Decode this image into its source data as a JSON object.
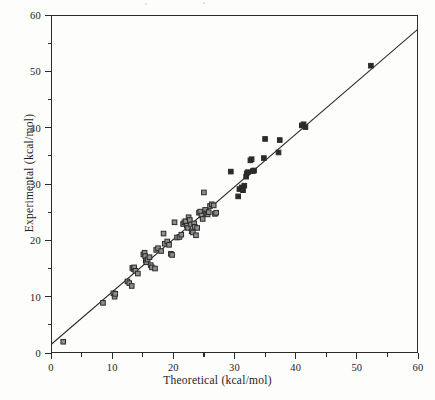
{
  "figure": {
    "title": "",
    "background_color": "#fdfdfc",
    "ink_color": "#2b2b2b"
  },
  "axes": {
    "x": {
      "label": "Theoretical (kcal/mol)",
      "major_ticks": [
        "0",
        "10",
        "20",
        "30",
        "40",
        "50",
        "60"
      ],
      "minor_ticks": [
        5,
        15,
        25,
        35,
        45,
        55
      ],
      "min": 0,
      "max": 60
    },
    "y": {
      "label": "Experimental (kcal/mol)",
      "major_ticks": [
        "0",
        "10",
        "20",
        "30",
        "40",
        "50",
        "60"
      ],
      "minor_ticks": [
        5,
        15,
        25,
        35,
        45,
        55
      ],
      "min": 0,
      "max": 60
    }
  },
  "chart_data": {
    "type": "scatter",
    "title": "",
    "xlabel": "Theoretical (kcal/mol)",
    "ylabel": "Experimental (kcal/mol)",
    "xlim": [
      0,
      60
    ],
    "ylim": [
      0,
      60
    ],
    "xticks": [
      0,
      10,
      20,
      30,
      40,
      50,
      60
    ],
    "yticks": [
      0,
      10,
      20,
      30,
      40,
      50,
      60
    ],
    "grid": false,
    "legend": null,
    "marker": {
      "shape": "square",
      "size_px": 4.6,
      "edge_color": "#2b2b2b",
      "face_color": "#8e8e8e"
    },
    "fit_line": {
      "type": "line",
      "color": "#2b2b2b",
      "width_px": 1.2,
      "slope": 0.933,
      "intercept": 1.5,
      "x_start": 0,
      "y_start": 1.5,
      "x_end": 60,
      "y_end": 57.5
    },
    "series": [
      {
        "name": "Theoretical vs Experimental",
        "points": [
          [
            2.0,
            2.0
          ],
          [
            8.5,
            8.9
          ],
          [
            10.2,
            10.6
          ],
          [
            10.4,
            10.0
          ],
          [
            10.5,
            10.5
          ],
          [
            12.5,
            12.7
          ],
          [
            12.8,
            12.4
          ],
          [
            13.2,
            11.9
          ],
          [
            13.3,
            15.1
          ],
          [
            13.5,
            14.9
          ],
          [
            13.6,
            15.2
          ],
          [
            13.8,
            14.6
          ],
          [
            14.2,
            14.1
          ],
          [
            15.1,
            17.5
          ],
          [
            15.3,
            17.8
          ],
          [
            15.4,
            17.2
          ],
          [
            15.5,
            16.4
          ],
          [
            15.6,
            16.1
          ],
          [
            15.8,
            16.6
          ],
          [
            16.1,
            17.0
          ],
          [
            16.3,
            15.6
          ],
          [
            16.5,
            15.2
          ],
          [
            17.0,
            15.0
          ],
          [
            17.2,
            18.3
          ],
          [
            17.5,
            18.6
          ],
          [
            18.0,
            18.1
          ],
          [
            18.4,
            21.2
          ],
          [
            18.6,
            19.4
          ],
          [
            19.0,
            19.8
          ],
          [
            19.3,
            19.2
          ],
          [
            19.6,
            17.6
          ],
          [
            19.8,
            17.4
          ],
          [
            20.2,
            23.2
          ],
          [
            20.6,
            20.5
          ],
          [
            21.0,
            20.6
          ],
          [
            21.3,
            21.0
          ],
          [
            21.6,
            22.9
          ],
          [
            21.8,
            23.2
          ],
          [
            22.0,
            23.4
          ],
          [
            22.2,
            22.6
          ],
          [
            22.4,
            22.2
          ],
          [
            22.5,
            24.1
          ],
          [
            22.7,
            23.6
          ],
          [
            22.9,
            22.8
          ],
          [
            23.0,
            21.6
          ],
          [
            23.2,
            21.4
          ],
          [
            23.4,
            23.0
          ],
          [
            23.5,
            22.4
          ],
          [
            23.7,
            20.9
          ],
          [
            23.9,
            22.2
          ],
          [
            24.2,
            24.9
          ],
          [
            24.4,
            25.1
          ],
          [
            24.6,
            24.4
          ],
          [
            24.8,
            23.8
          ],
          [
            25.0,
            28.5
          ],
          [
            25.2,
            25.4
          ],
          [
            25.4,
            24.8
          ],
          [
            25.6,
            24.6
          ],
          [
            25.8,
            25.0
          ],
          [
            26.0,
            26.1
          ],
          [
            26.3,
            26.4
          ],
          [
            26.6,
            26.2
          ],
          [
            26.8,
            24.7
          ],
          [
            27.0,
            24.9
          ],
          [
            29.4,
            32.2
          ],
          [
            30.6,
            27.8
          ],
          [
            30.8,
            29.1
          ],
          [
            31.2,
            29.4
          ],
          [
            31.4,
            28.9
          ],
          [
            31.6,
            29.7
          ],
          [
            31.9,
            31.3
          ],
          [
            32.0,
            31.9
          ],
          [
            32.2,
            32.1
          ],
          [
            32.6,
            34.2
          ],
          [
            32.8,
            34.4
          ],
          [
            33.0,
            32.3
          ],
          [
            33.2,
            32.4
          ],
          [
            34.8,
            34.6
          ],
          [
            35.0,
            38.0
          ],
          [
            37.2,
            35.6
          ],
          [
            37.4,
            37.8
          ],
          [
            41.0,
            40.4
          ],
          [
            41.3,
            40.6
          ],
          [
            41.6,
            40.1
          ],
          [
            52.3,
            51.0
          ]
        ]
      }
    ]
  }
}
